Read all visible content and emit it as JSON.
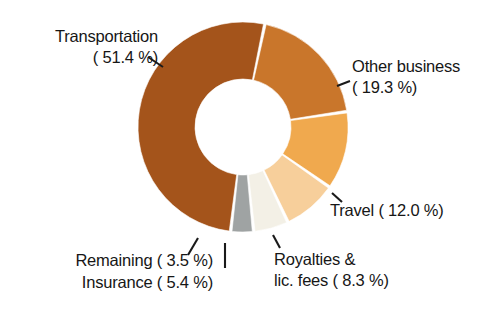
{
  "chart_data": {
    "type": "pie",
    "variant": "donut",
    "title": "",
    "subtitle": "",
    "xlabel": "",
    "ylabel": "",
    "legend_position": "none",
    "grid": false,
    "units": "percent",
    "total": 99.9,
    "categories": [
      "Transportation",
      "Other business",
      "Travel",
      "Royalties & lic. fees",
      "Insurance",
      "Remaining"
    ],
    "values": [
      51.4,
      19.3,
      12.0,
      8.3,
      5.4,
      3.5
    ],
    "colors": [
      "#a4541b",
      "#c9762b",
      "#f0a94e",
      "#f7cf9b",
      "#f3f0e6",
      "#9fa3a3"
    ],
    "slices": [
      {
        "name": "Transportation",
        "value": 51.4,
        "color": "#a4541b",
        "label_lines": [
          "Transportation",
          "( 51.4 %)"
        ],
        "label_position": "upper-left"
      },
      {
        "name": "Other business",
        "value": 19.3,
        "color": "#c9762b",
        "label_lines": [
          "Other business",
          "( 19.3 %)"
        ],
        "label_position": "right-top"
      },
      {
        "name": "Travel",
        "value": 12.0,
        "color": "#f0a94e",
        "label_lines": [
          "Travel ( 12.0 %)"
        ],
        "label_position": "right-bottom"
      },
      {
        "name": "Royalties & lic. fees",
        "value": 8.3,
        "color": "#f7cf9b",
        "label_lines": [
          "Royalties &",
          "lic. fees (  8.3 %)"
        ],
        "label_position": "bottom-right"
      },
      {
        "name": "Insurance",
        "value": 5.4,
        "color": "#f3f0e6",
        "label_lines": [
          "Insurance (  5.4 %)"
        ],
        "label_position": "bottom-left"
      },
      {
        "name": "Remaining",
        "value": 3.5,
        "color": "#9fa3a3",
        "label_lines": [
          "Remaining (  3.5 %)"
        ],
        "label_position": "bottom-left"
      }
    ]
  },
  "labels": {
    "transportation_line1": "Transportation",
    "transportation_line2": "( 51.4 %)",
    "other_business_line1": "Other business",
    "other_business_line2": "( 19.3 %)",
    "travel_line1": "Travel ( 12.0 %)",
    "royalties_line1": "Royalties &",
    "royalties_line2": "lic. fees (  8.3 %)",
    "remaining_line1": "Remaining (  3.5 %)",
    "insurance_line1": "Insurance (  5.4 %)"
  },
  "colors": {
    "background": "#ffffff",
    "text": "#161616",
    "leader": "#1a1a1a",
    "transportation": "#a4541b",
    "other_business": "#c9762b",
    "travel": "#f0a94e",
    "royalties": "#f7cf9b",
    "insurance": "#f3f0e6",
    "remaining": "#9fa3a3"
  }
}
